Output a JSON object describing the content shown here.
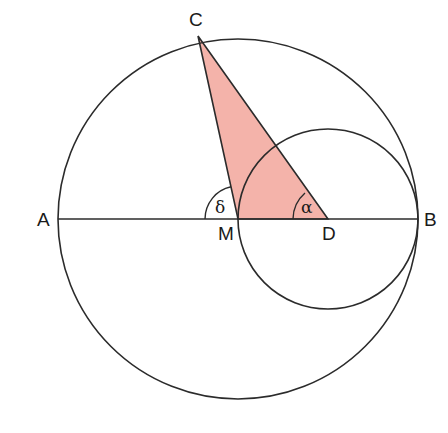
{
  "diagram": {
    "type": "geometry",
    "colors": {
      "stroke": "#2b2b2b",
      "triangle_fill": "#f4b3aa",
      "background": "#ffffff"
    },
    "points": {
      "A": {
        "label": "A",
        "x": 58,
        "y": 219
      },
      "B": {
        "label": "B",
        "x": 418,
        "y": 219
      },
      "C": {
        "label": "C",
        "x": 198,
        "y": 36
      },
      "M": {
        "label": "M",
        "x": 238,
        "y": 219
      },
      "D": {
        "label": "D",
        "x": 328,
        "y": 219
      }
    },
    "circles": [
      {
        "name": "large-circle",
        "center": "M",
        "radius": 180
      },
      {
        "name": "small-circle",
        "center": "D",
        "radius": 90
      }
    ],
    "segments": [
      {
        "name": "diameter-AB",
        "from": "A",
        "to": "B"
      },
      {
        "name": "segment-CM",
        "from": "C",
        "to": "M"
      },
      {
        "name": "segment-CD",
        "from": "C",
        "to": "D"
      }
    ],
    "triangle": {
      "name": "triangle-CMD",
      "vertices": [
        "C",
        "M",
        "D"
      ]
    },
    "angles": [
      {
        "name": "angle-delta",
        "label": "δ",
        "vertex": "M",
        "between": [
          "A",
          "C"
        ]
      },
      {
        "name": "angle-alpha",
        "label": "α",
        "vertex": "D",
        "between": [
          "C",
          "M"
        ]
      }
    ]
  }
}
